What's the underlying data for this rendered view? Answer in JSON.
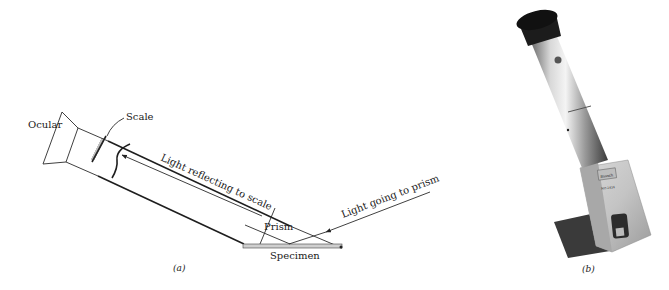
{
  "figure": {
    "panel_a": {
      "caption": "(a)",
      "labels": {
        "ocular": "Ocular",
        "scale": "Scale",
        "light_reflecting": "Light reflecting to scale",
        "prism": "Prism",
        "specimen": "Specimen",
        "light_going": "Light going to prism"
      }
    },
    "panel_b": {
      "caption": "(b)",
      "device_brand": "Bausch",
      "device_model": "NO 2434"
    }
  }
}
